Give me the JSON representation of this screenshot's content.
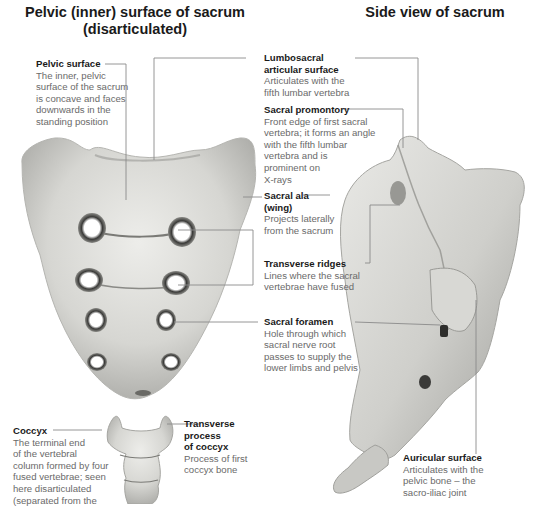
{
  "titles": {
    "left": "Pelvic (inner) surface of sacrum",
    "left_sub": "(disarticulated)",
    "right": "Side view of sacrum"
  },
  "labels": {
    "pelvic_surface": {
      "heading": "Pelvic surface",
      "lines": [
        "The inner, pelvic",
        "surface of the sacrum",
        "is concave and faces",
        "downwards in the",
        "standing position"
      ]
    },
    "lumbosacral": {
      "heading": [
        "Lumbosacral",
        "articular surface"
      ],
      "lines": [
        "Articulates with the",
        "fifth lumbar vertebra"
      ]
    },
    "promontory": {
      "heading": "Sacral promontory",
      "lines": [
        "Front edge of first sacral",
        "vertebra; it forms an angle",
        "with the fifth lumbar",
        "vertebra and is",
        "prominent on",
        "X-rays"
      ]
    },
    "ala": {
      "heading": [
        "Sacral ala",
        "(wing)"
      ],
      "lines": [
        "Projects laterally",
        "from the sacrum"
      ]
    },
    "ridges": {
      "heading": "Transverse ridges",
      "lines": [
        "Lines where the sacral",
        "vertebrae have fused"
      ]
    },
    "foramen": {
      "heading": "Sacral foramen",
      "lines": [
        "Hole through which",
        "sacral nerve root",
        "passes to supply the",
        "lower limbs and pelvis"
      ]
    },
    "coccyx": {
      "heading": "Coccyx",
      "lines": [
        "The terminal end",
        "of the vertebral",
        "column formed by four",
        "fused vertebrae; seen",
        "here disarticulated",
        "(separated from the"
      ]
    },
    "transverse_coccyx": {
      "heading": [
        "Transverse",
        "process",
        "of coccyx"
      ],
      "lines": [
        "Process of first",
        "coccyx bone"
      ]
    },
    "auricular": {
      "heading": "Auricular surface",
      "lines": [
        "Articulates with the",
        "pelvic bone – the",
        "sacro-iliac joint"
      ]
    }
  },
  "colors": {
    "leader_line": "#8a8a8a",
    "bone_light": "#e6e6e3",
    "bone_mid": "#bdbdb9",
    "bone_dark": "#5a5a58",
    "heading_text": "#1a1a1a",
    "body_text": "#6a6a6a"
  }
}
